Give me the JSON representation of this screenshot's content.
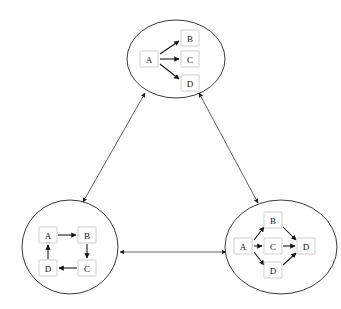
{
  "diagram": {
    "background_color": "#ffffff",
    "ellipse_stroke_color": "#222222",
    "node_border_color": "#c9c9c9",
    "node_fill_color": "#ffffff",
    "edge_color": "#111111",
    "connector_color": "#444444",
    "clusters": [
      {
        "id": "top",
        "name": "star-graph",
        "center": {
          "x": 176,
          "y": 59
        },
        "rx": 49,
        "ry": 39,
        "nodes": [
          {
            "id": "A",
            "label": "A",
            "x": 149,
            "y": 59
          },
          {
            "id": "B",
            "label": "B",
            "x": 190,
            "y": 38
          },
          {
            "id": "C",
            "label": "C",
            "x": 190,
            "y": 59
          },
          {
            "id": "D",
            "label": "D",
            "x": 190,
            "y": 83
          }
        ],
        "edges": [
          {
            "from": "A",
            "to": "B",
            "directed": true
          },
          {
            "from": "A",
            "to": "C",
            "directed": true
          },
          {
            "from": "A",
            "to": "D",
            "directed": true
          }
        ]
      },
      {
        "id": "bottom-left",
        "name": "cycle-graph",
        "center": {
          "x": 70,
          "y": 247
        },
        "rx": 48,
        "ry": 47,
        "nodes": [
          {
            "id": "A",
            "label": "A",
            "x": 48,
            "y": 235
          },
          {
            "id": "B",
            "label": "B",
            "x": 87,
            "y": 235
          },
          {
            "id": "C",
            "label": "C",
            "x": 87,
            "y": 268
          },
          {
            "id": "D",
            "label": "D",
            "x": 48,
            "y": 268
          }
        ],
        "edges": [
          {
            "from": "A",
            "to": "B",
            "directed": true
          },
          {
            "from": "B",
            "to": "C",
            "directed": true
          },
          {
            "from": "C",
            "to": "D",
            "directed": true
          },
          {
            "from": "D",
            "to": "A",
            "directed": true
          }
        ]
      },
      {
        "id": "bottom-right",
        "name": "diamond-graph",
        "center": {
          "x": 281,
          "y": 247
        },
        "rx": 56,
        "ry": 47,
        "nodes": [
          {
            "id": "A",
            "label": "A",
            "x": 243,
            "y": 246
          },
          {
            "id": "B",
            "label": "B",
            "x": 273,
            "y": 220
          },
          {
            "id": "C",
            "label": "C",
            "x": 273,
            "y": 246
          },
          {
            "id": "D2",
            "label": "D",
            "x": 273,
            "y": 270
          },
          {
            "id": "D1",
            "label": "D",
            "x": 306,
            "y": 246
          }
        ],
        "edges": [
          {
            "from": "A",
            "to": "B",
            "directed": true
          },
          {
            "from": "A",
            "to": "C",
            "directed": true
          },
          {
            "from": "A",
            "to": "D2",
            "directed": true
          },
          {
            "from": "B",
            "to": "D1",
            "directed": true
          },
          {
            "from": "C",
            "to": "D1",
            "directed": true
          },
          {
            "from": "D2",
            "to": "D1",
            "directed": true
          }
        ]
      }
    ],
    "connectors": [
      {
        "id": "top-to-bottom-left",
        "from": "top",
        "to": "bottom-left",
        "bidirectional": true,
        "x1": 145,
        "y1": 93,
        "x2": 83,
        "y2": 202
      },
      {
        "id": "top-to-bottom-right",
        "from": "top",
        "to": "bottom-right",
        "bidirectional": true,
        "x1": 199,
        "y1": 93,
        "x2": 258,
        "y2": 203
      },
      {
        "id": "bottom-left-to-bottom-right",
        "from": "bottom-left",
        "to": "bottom-right",
        "bidirectional": true,
        "x1": 120,
        "y1": 252,
        "x2": 226,
        "y2": 252
      }
    ]
  }
}
